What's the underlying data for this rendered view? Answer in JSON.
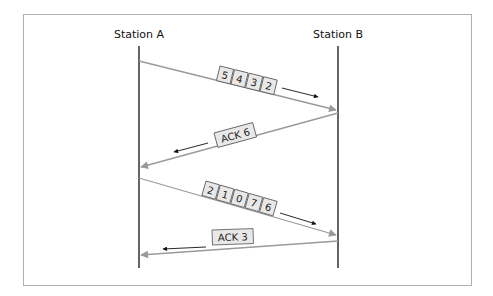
{
  "diagram": {
    "stations": [
      {
        "id": "A",
        "label": "Station A"
      },
      {
        "id": "B",
        "label": "Station B"
      }
    ],
    "messages": [
      {
        "from": "A",
        "to": "B",
        "kind": "frames",
        "frames": [
          "5",
          "4",
          "3",
          "2"
        ]
      },
      {
        "from": "B",
        "to": "A",
        "kind": "ack",
        "label": "ACK 6"
      },
      {
        "from": "A",
        "to": "B",
        "kind": "frames",
        "frames": [
          "2",
          "1",
          "0",
          "7",
          "6"
        ]
      },
      {
        "from": "B",
        "to": "A",
        "kind": "ack",
        "label": "ACK 3"
      }
    ],
    "colors": {
      "frame_border": "#b0b0b0",
      "timeline": "#111111",
      "message_line": "#9a9a9a",
      "direction_arrow": "#111111",
      "box_fill": "#e8e8e8"
    }
  }
}
